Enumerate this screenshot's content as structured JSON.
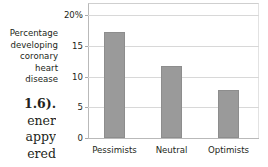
{
  "page": {
    "body_text_lines": [
      "1.6).",
      "ener",
      "appy",
      "ered"
    ]
  },
  "chart_data": {
    "type": "bar",
    "title": "",
    "xlabel": "",
    "ylabel": "Percentage developing coronary heart disease",
    "ylabel_lines": [
      "Percentage",
      "developing",
      "coronary",
      "heart disease"
    ],
    "categories": [
      "Pessimists",
      "Neutral",
      "Optimists"
    ],
    "values": [
      17.3,
      11.8,
      7.8
    ],
    "ylim": [
      0,
      22
    ],
    "yticks": [
      0,
      5,
      10,
      15,
      20
    ],
    "ytick_labels": [
      "0",
      "5",
      "10",
      "15",
      "20%"
    ],
    "grid": true,
    "legend": "none",
    "bar_color": "#9a9a9a",
    "grid_color": "#d8d8d8",
    "axis_color": "#b9b9b9",
    "text_color": "#231f20"
  }
}
